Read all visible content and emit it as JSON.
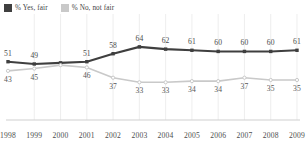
{
  "legend": {
    "position": "top-left",
    "items": [
      {
        "label": "% Yes, fair",
        "color": "#3f3f3f",
        "icon": "square-swatch"
      },
      {
        "label": "% No, not fair",
        "color": "#c9c9c9",
        "icon": "square-swatch"
      }
    ]
  },
  "chart_data": {
    "type": "line",
    "title": "",
    "subtitle": "",
    "xlabel": "",
    "ylabel": "",
    "grid": "vertical-only",
    "legend_position": "top-left",
    "ylim": [
      0,
      70
    ],
    "categories": [
      "1998",
      "1999",
      "2000",
      "2001",
      "2002",
      "2003",
      "2004",
      "2005",
      "2006",
      "2007",
      "2008",
      "2009"
    ],
    "x": [
      "1998",
      "1999",
      "2000",
      "2001",
      "2002",
      "2003",
      "2004",
      "2005",
      "2006",
      "2007",
      "2008",
      "2009"
    ],
    "series": [
      {
        "name": "% Yes, fair",
        "color": "#3f3f3f",
        "marker": "square",
        "values": [
          51,
          49,
          50,
          51,
          58,
          64,
          62,
          61,
          60,
          60,
          60,
          61
        ],
        "labels": [
          "51",
          "49",
          "",
          "51",
          "58",
          "64",
          "62",
          "61",
          "60",
          "60",
          "60",
          "61"
        ],
        "label_position": "above"
      },
      {
        "name": "% No, not fair",
        "color": "#c9c9c9",
        "marker": "circle",
        "values": [
          43,
          45,
          48,
          46,
          37,
          33,
          33,
          34,
          34,
          37,
          35,
          35
        ],
        "labels": [
          "43",
          "45",
          "",
          "46",
          "37",
          "33",
          "33",
          "34",
          "34",
          "37",
          "35",
          "35"
        ],
        "label_position": "below"
      }
    ]
  },
  "axis": {
    "x_tick_labels": [
      "1998",
      "1999",
      "2000",
      "2001",
      "2002",
      "2003",
      "2004",
      "2005",
      "2006",
      "2007",
      "2008",
      "2009"
    ]
  }
}
